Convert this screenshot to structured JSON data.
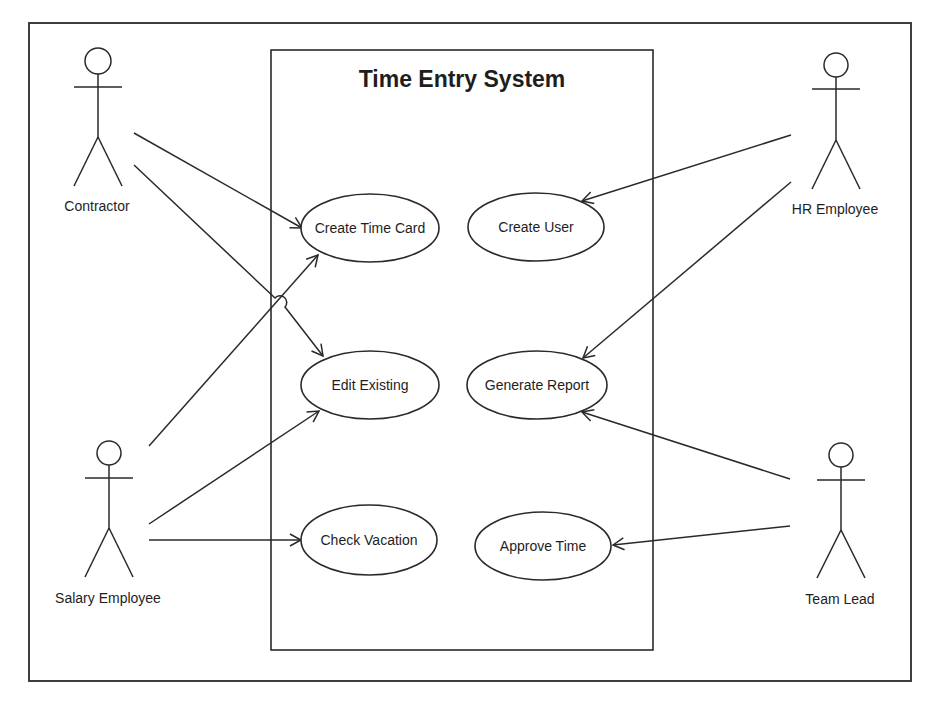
{
  "diagram": {
    "type": "uml-use-case",
    "system": {
      "title": "Time Entry System"
    },
    "actors": [
      {
        "id": "contractor",
        "label": "Contractor"
      },
      {
        "id": "hr",
        "label": "HR Employee"
      },
      {
        "id": "salary",
        "label": "Salary Employee"
      },
      {
        "id": "teamlead",
        "label": "Team Lead"
      }
    ],
    "use_cases": [
      {
        "id": "create_time_card",
        "label": "Create Time Card"
      },
      {
        "id": "create_user",
        "label": "Create User"
      },
      {
        "id": "edit_existing",
        "label": "Edit Existing"
      },
      {
        "id": "generate_report",
        "label": "Generate Report"
      },
      {
        "id": "check_vacation",
        "label": "Check Vacation"
      },
      {
        "id": "approve_time",
        "label": "Approve Time"
      }
    ],
    "associations": [
      {
        "from": "Contractor",
        "to": "Create Time Card"
      },
      {
        "from": "Contractor",
        "to": "Edit Existing"
      },
      {
        "from": "Salary Employee",
        "to": "Create Time Card"
      },
      {
        "from": "Salary Employee",
        "to": "Edit Existing"
      },
      {
        "from": "Salary Employee",
        "to": "Check Vacation"
      },
      {
        "from": "HR Employee",
        "to": "Create User"
      },
      {
        "from": "HR Employee",
        "to": "Generate Report"
      },
      {
        "from": "Team Lead",
        "to": "Generate Report"
      },
      {
        "from": "Team Lead",
        "to": "Approve Time"
      }
    ],
    "colors": {
      "stroke": "#2a2a2a",
      "text": "#1e1e1e",
      "background": "#ffffff"
    }
  }
}
